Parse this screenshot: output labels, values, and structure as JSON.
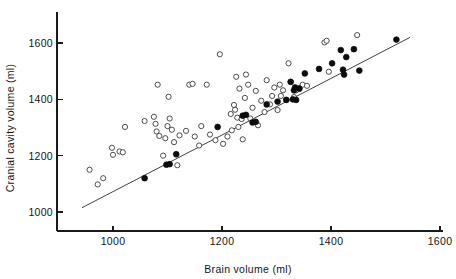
{
  "chart_data": {
    "type": "scatter",
    "title": "",
    "xlabel": "Brain volume (ml)",
    "ylabel": "Cranial cavity volume (ml)",
    "xlim": [
      880,
      1620
    ],
    "ylim": [
      960,
      1690
    ],
    "xticks": [
      1000,
      1200,
      1400,
      1600
    ],
    "yticks": [
      1000,
      1200,
      1400,
      1600
    ],
    "xtick_labels": [
      "1000",
      "1200",
      "1400",
      "1600"
    ],
    "ytick_labels": [
      "1000",
      "1200",
      "1400",
      "1600"
    ],
    "grid": false,
    "legend": "none",
    "fit_line": {
      "label": "regression line",
      "x": [
        943,
        1545
      ],
      "y": [
        1015,
        1620
      ]
    },
    "series": [
      {
        "name": "open-circles",
        "marker": "open circle",
        "color": "#ffffff",
        "edge_color": "#3a3a3a",
        "points": [
          [
            957,
            1150
          ],
          [
            972,
            1098
          ],
          [
            982,
            1120
          ],
          [
            998,
            1228
          ],
          [
            1000,
            1203
          ],
          [
            1012,
            1215
          ],
          [
            1018,
            1212
          ],
          [
            1022,
            1302
          ],
          [
            1058,
            1323
          ],
          [
            1075,
            1338
          ],
          [
            1078,
            1313
          ],
          [
            1080,
            1286
          ],
          [
            1082,
            1452
          ],
          [
            1085,
            1270
          ],
          [
            1092,
            1200
          ],
          [
            1096,
            1262
          ],
          [
            1100,
            1305
          ],
          [
            1102,
            1409
          ],
          [
            1104,
            1332
          ],
          [
            1108,
            1292
          ],
          [
            1112,
            1248
          ],
          [
            1118,
            1166
          ],
          [
            1122,
            1272
          ],
          [
            1134,
            1288
          ],
          [
            1140,
            1452
          ],
          [
            1146,
            1455
          ],
          [
            1150,
            1268
          ],
          [
            1158,
            1236
          ],
          [
            1162,
            1305
          ],
          [
            1172,
            1452
          ],
          [
            1178,
            1275
          ],
          [
            1188,
            1255
          ],
          [
            1196,
            1560
          ],
          [
            1202,
            1242
          ],
          [
            1210,
            1268
          ],
          [
            1216,
            1348
          ],
          [
            1218,
            1290
          ],
          [
            1222,
            1380
          ],
          [
            1224,
            1363
          ],
          [
            1226,
            1480
          ],
          [
            1228,
            1335
          ],
          [
            1230,
            1302
          ],
          [
            1232,
            1438
          ],
          [
            1236,
            1330
          ],
          [
            1238,
            1258
          ],
          [
            1242,
            1405
          ],
          [
            1244,
            1488
          ],
          [
            1248,
            1452
          ],
          [
            1252,
            1332
          ],
          [
            1256,
            1370
          ],
          [
            1262,
            1430
          ],
          [
            1266,
            1308
          ],
          [
            1272,
            1395
          ],
          [
            1278,
            1355
          ],
          [
            1282,
            1468
          ],
          [
            1288,
            1382
          ],
          [
            1292,
            1412
          ],
          [
            1296,
            1442
          ],
          [
            1302,
            1362
          ],
          [
            1306,
            1452
          ],
          [
            1308,
            1412
          ],
          [
            1312,
            1432
          ],
          [
            1318,
            1398
          ],
          [
            1322,
            1528
          ],
          [
            1326,
            1462
          ],
          [
            1332,
            1408
          ],
          [
            1336,
            1432
          ],
          [
            1342,
            1440
          ],
          [
            1348,
            1452
          ],
          [
            1356,
            1448
          ],
          [
            1388,
            1602
          ],
          [
            1392,
            1608
          ],
          [
            1396,
            1498
          ],
          [
            1448,
            1628
          ]
        ]
      },
      {
        "name": "filled-circles",
        "marker": "filled circle",
        "color": "#0c0c0c",
        "edge_color": "#0c0c0c",
        "points": [
          [
            1058,
            1120
          ],
          [
            1098,
            1168
          ],
          [
            1104,
            1170
          ],
          [
            1116,
            1205
          ],
          [
            1192,
            1302
          ],
          [
            1238,
            1342
          ],
          [
            1244,
            1345
          ],
          [
            1256,
            1318
          ],
          [
            1262,
            1320
          ],
          [
            1282,
            1382
          ],
          [
            1302,
            1392
          ],
          [
            1318,
            1398
          ],
          [
            1326,
            1462
          ],
          [
            1330,
            1400
          ],
          [
            1332,
            1432
          ],
          [
            1334,
            1442
          ],
          [
            1336,
            1398
          ],
          [
            1342,
            1438
          ],
          [
            1352,
            1492
          ],
          [
            1378,
            1508
          ],
          [
            1402,
            1528
          ],
          [
            1418,
            1575
          ],
          [
            1422,
            1505
          ],
          [
            1424,
            1488
          ],
          [
            1428,
            1550
          ],
          [
            1442,
            1578
          ],
          [
            1452,
            1502
          ],
          [
            1520,
            1612
          ]
        ]
      }
    ]
  },
  "axes": {
    "x_title": "Brain volume (ml)",
    "y_title": "Cranial cavity volume (ml)"
  }
}
